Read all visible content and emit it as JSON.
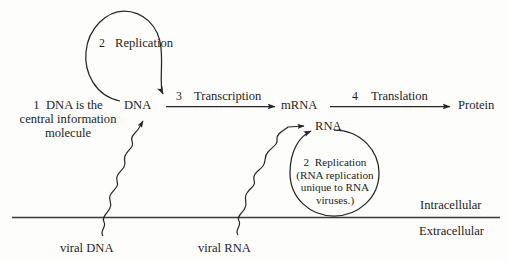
{
  "diagram": {
    "title_nodes": {
      "dna": "DNA",
      "mrna": "mRNA",
      "protein": "Protein",
      "rna": "RNA"
    },
    "annotations": {
      "step1_number": "1",
      "step1_text_line1": "DNA is the",
      "step1_text_line2": "central information",
      "step1_text_line3": "molecule",
      "step2_number": "2",
      "step2_label": "Replication",
      "step3_number": "3",
      "step3_label": "Transcription",
      "step4_number": "4",
      "step4_label": "Translation",
      "rna_rep_number": "2",
      "rna_rep_label": "Replication",
      "rna_rep_note_line1": "(RNA replication",
      "rna_rep_note_line2": "unique to RNA",
      "rna_rep_note_line3": "viruses.)"
    },
    "compartments": {
      "inside": "Intracellular",
      "outside": "Extracellular"
    },
    "viral_entries": {
      "dna_entry": "viral DNA",
      "rna_entry": "viral RNA"
    },
    "colors": {
      "background": "#fdfdfc",
      "ink": "#262626",
      "membrane": "#3a3a3a"
    }
  }
}
